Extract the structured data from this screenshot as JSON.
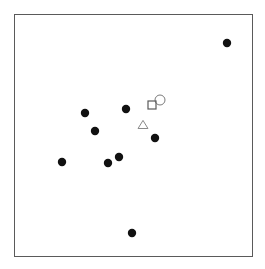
{
  "chart_data": {
    "type": "scatter",
    "title": "",
    "subtitle": "",
    "xlabel": "",
    "ylabel": "",
    "grid": false,
    "legend_position": "none",
    "axis_ticks": [],
    "xlim": [
      0,
      100
    ],
    "ylim": [
      0,
      100
    ],
    "frame": {
      "x": 14,
      "y": 14,
      "width": 238,
      "height": 242,
      "stroke": "#5a5a5a",
      "stroke_width": 1,
      "fill": "#ffffff"
    },
    "series": [
      {
        "name": "observations",
        "marker": "filled-circle",
        "color": "#111111",
        "size": 4.2,
        "points": [
          {
            "px": 227,
            "py": 43,
            "x": 89.5,
            "y": 88.0
          },
          {
            "px": 126,
            "py": 109,
            "x": 47.1,
            "y": 60.7
          },
          {
            "px": 85,
            "py": 113,
            "x": 29.8,
            "y": 59.1
          },
          {
            "px": 95,
            "py": 131,
            "x": 34.0,
            "y": 51.7
          },
          {
            "px": 155,
            "py": 138,
            "x": 59.2,
            "y": 48.8
          },
          {
            "px": 119,
            "py": 157,
            "x": 44.1,
            "y": 40.9
          },
          {
            "px": 62,
            "py": 162,
            "x": 20.2,
            "y": 38.8
          },
          {
            "px": 108,
            "py": 163,
            "x": 39.5,
            "y": 38.4
          },
          {
            "px": 132,
            "py": 233,
            "x": 49.6,
            "y": 9.5
          }
        ]
      },
      {
        "name": "open-circle-marker",
        "marker": "open-circle",
        "color": "#7a7a7a",
        "size": 5.0,
        "points": [
          {
            "px": 160,
            "py": 100,
            "x": 61.3,
            "y": 64.5
          }
        ]
      },
      {
        "name": "open-square-marker",
        "marker": "open-square",
        "color": "#5a5a5a",
        "size": 5.4,
        "points": [
          {
            "px": 152,
            "py": 105,
            "x": 58.0,
            "y": 62.4
          }
        ]
      },
      {
        "name": "open-triangle-marker",
        "marker": "open-triangle",
        "color": "#8a8a8a",
        "size": 5.4,
        "points": [
          {
            "px": 143,
            "py": 125,
            "x": 54.2,
            "y": 54.1
          }
        ]
      }
    ]
  }
}
